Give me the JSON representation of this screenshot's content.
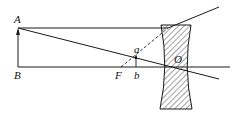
{
  "diagram": {
    "type": "optics-ray-diagram",
    "lens": "concave (diverging) lens, hatched",
    "labels": {
      "A": "A",
      "B": "B",
      "F": "F",
      "O": "O",
      "a": "a",
      "b": "b"
    },
    "colors": {
      "stroke": "#1a1a1a",
      "background": "#ffffff"
    }
  }
}
